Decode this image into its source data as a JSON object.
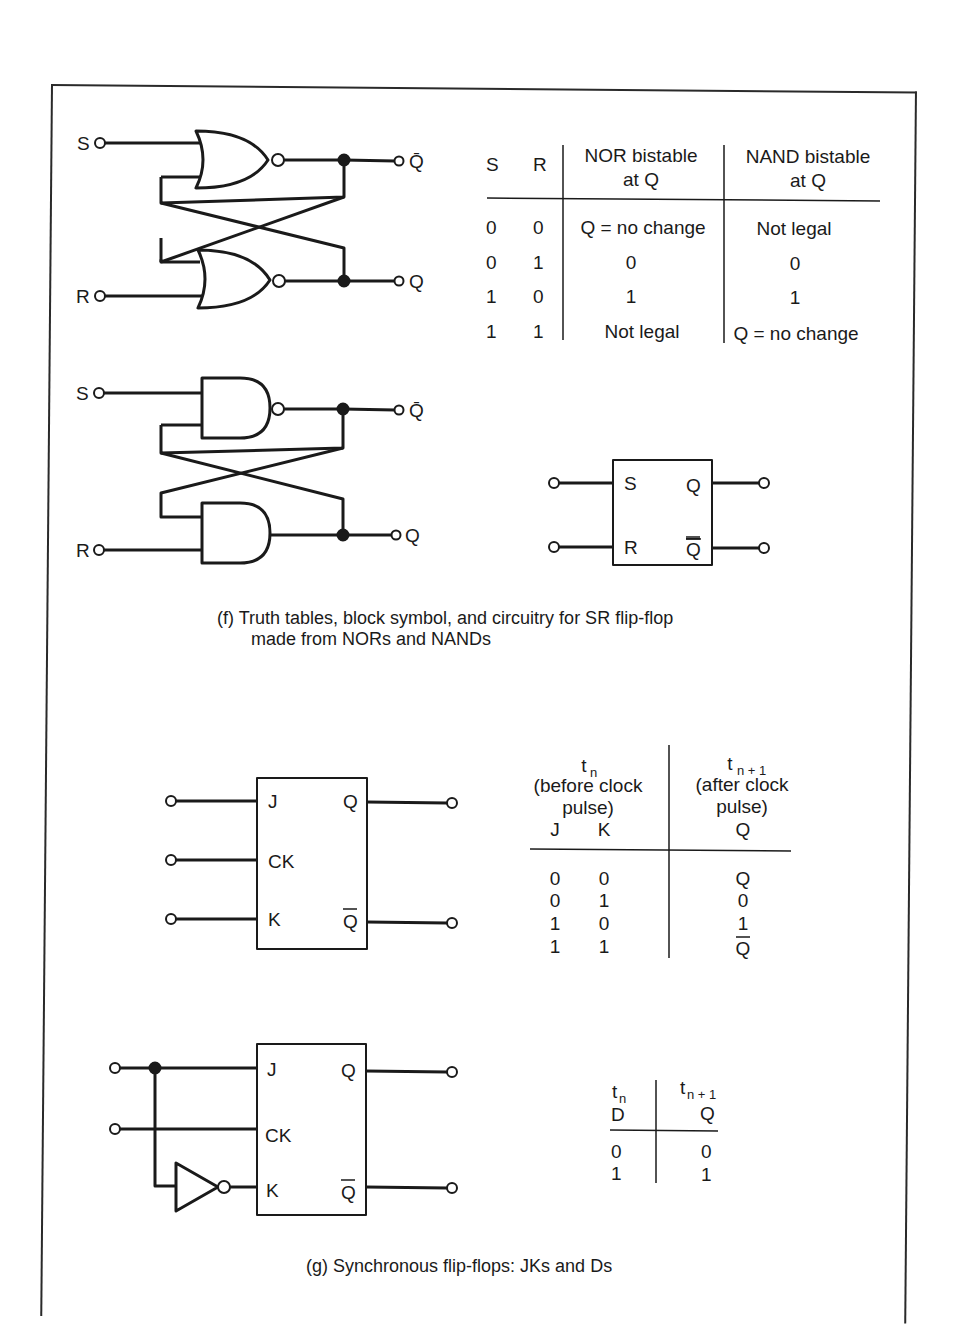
{
  "figure_f": {
    "nor_circuit": {
      "input_s": "S",
      "input_r": "R",
      "output_qbar": "Q̄",
      "output_q": "Q",
      "gate_type": "NOR"
    },
    "nand_circuit": {
      "input_s": "S",
      "input_r": "R",
      "output_qbar": "Q̄",
      "output_q": "Q",
      "gate_type": "NAND"
    },
    "truth_table": {
      "headers": [
        "S",
        "R",
        "NOR bistable",
        "NAND bistable"
      ],
      "headers_line2": [
        "",
        "",
        "at Q",
        "at Q"
      ],
      "rows": [
        [
          "0",
          "0",
          "Q = no change",
          "Not legal"
        ],
        [
          "0",
          "1",
          "0",
          "0"
        ],
        [
          "1",
          "0",
          "1",
          "1"
        ],
        [
          "1",
          "1",
          "Not legal",
          "Q = no change"
        ]
      ]
    },
    "block_symbol": {
      "pin_s": "S",
      "pin_r": "R",
      "pin_q": "Q",
      "pin_qbar": "Q"
    },
    "caption_line1": "(f)  Truth tables, block symbol, and circuitry for SR flip-flop",
    "caption_line2": "made from NORs and NANDs"
  },
  "figure_g": {
    "jk_block": {
      "pin_j": "J",
      "pin_ck": "CK",
      "pin_k": "K",
      "pin_q": "Q",
      "pin_qbar": "Q"
    },
    "jk_table": {
      "left_head_t": "t",
      "left_head_sub": "n",
      "left_head_line2": "(before clock",
      "left_head_line3": "pulse)",
      "right_head_t": "t",
      "right_head_sub": "n + 1",
      "right_head_line2": "(after clock",
      "right_head_line3": "pulse)",
      "col_j": "J",
      "col_k": "K",
      "col_q": "Q",
      "rows": [
        [
          "0",
          "0",
          "Q"
        ],
        [
          "0",
          "1",
          "0"
        ],
        [
          "1",
          "0",
          "1"
        ],
        [
          "1",
          "1",
          "Q"
        ]
      ],
      "row4_q_overlined": true
    },
    "d_block": {
      "pin_j": "J",
      "pin_ck": "CK",
      "pin_k": "K",
      "pin_q": "Q",
      "pin_qbar": "Q"
    },
    "d_table": {
      "left_head_t": "t",
      "left_head_sub": "n",
      "col_d": "D",
      "right_head_t": "t",
      "right_head_sub": "n + 1",
      "col_q": "Q",
      "rows": [
        [
          "0",
          "0"
        ],
        [
          "1",
          "1"
        ]
      ]
    },
    "caption": "(g)  Synchronous flip-flops:  JKs and Ds"
  }
}
